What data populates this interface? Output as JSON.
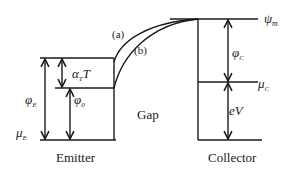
{
  "diagram": {
    "labels": {
      "psi_m": "ψ",
      "psi_m_sub": "m",
      "curve_a": "(a)",
      "curve_b": "(b)",
      "alpha_T": "α",
      "alpha_T_sub": "T",
      "alpha_T_tail": "T",
      "phi_E": "φ",
      "phi_E_sub": "E",
      "phi_0": "φ",
      "phi_0_sub": "0",
      "phi_C": "φ",
      "phi_C_sub": "C",
      "mu_C": "μ",
      "mu_C_sub": "C",
      "mu_E": "μ",
      "mu_E_sub": "E",
      "eV": "eV",
      "gap": "Gap",
      "emitter": "Emitter",
      "collector": "Collector"
    },
    "stroke_color": "#1a1a1a"
  }
}
